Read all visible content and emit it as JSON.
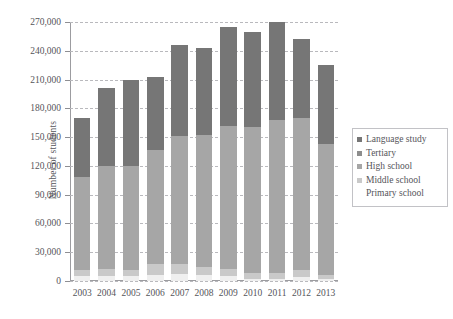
{
  "chart_data": {
    "type": "bar",
    "subtype": "stacked",
    "title": "",
    "xlabel": "",
    "ylabel": "Number of students",
    "ylim": [
      0,
      270000
    ],
    "ytick_step": 30000,
    "ytick_labels": [
      "0",
      "30,000",
      "60,000",
      "90,000",
      "120,000",
      "150,000",
      "180,000",
      "210,000",
      "240,000",
      "270,000"
    ],
    "ytick_values": [
      0,
      30000,
      60000,
      90000,
      120000,
      150000,
      180000,
      210000,
      240000,
      270000
    ],
    "grid": true,
    "legend_position": "right",
    "categories": [
      "2003",
      "2004",
      "2005",
      "2006",
      "2007",
      "2008",
      "2009",
      "2010",
      "2011",
      "2012",
      "2013"
    ],
    "series": [
      {
        "name": "Primary school",
        "color": "#efefef",
        "values": [
          5000,
          5000,
          5000,
          6000,
          7000,
          6000,
          5000,
          2000,
          2000,
          4000,
          2000
        ]
      },
      {
        "name": "Middle school",
        "color": "#c9c9c9",
        "values": [
          7000,
          8000,
          7000,
          12000,
          11000,
          9000,
          8000,
          6000,
          6000,
          7000,
          4000
        ]
      },
      {
        "name": "High school",
        "color": "#a6a6a6",
        "values": [
          96000,
          107000,
          108000,
          119000,
          133000,
          137000,
          149000,
          153000,
          160000,
          159000,
          137000
        ]
      },
      {
        "name": "Tertiary",
        "color": "#8d8d8d",
        "values": [
          0,
          0,
          0,
          0,
          0,
          0,
          0,
          0,
          0,
          0,
          0
        ]
      },
      {
        "name": "Language study",
        "color": "#767676",
        "values": [
          62000,
          81000,
          90000,
          76000,
          95000,
          91000,
          103000,
          99000,
          102000,
          82000,
          82000
        ]
      }
    ],
    "totals": [
      170000,
      201000,
      210000,
      213000,
      246000,
      243000,
      265000,
      260000,
      270000,
      252000,
      225000
    ],
    "legend_entries": [
      {
        "label": "Language study",
        "color": "#767676",
        "swatch": true
      },
      {
        "label": "Tertiary",
        "color": "#8d8d8d",
        "swatch": true
      },
      {
        "label": "High school",
        "color": "#a6a6a6",
        "swatch": true
      },
      {
        "label": "Middle school",
        "color": "#c9c9c9",
        "swatch": true
      },
      {
        "label": "Primary school",
        "color": "#efefef",
        "swatch": false
      }
    ]
  }
}
